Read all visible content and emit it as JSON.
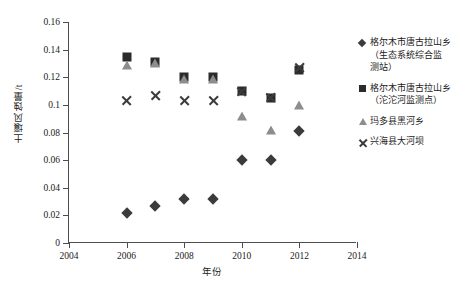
{
  "chart_data": {
    "type": "scatter",
    "title": "",
    "xlabel": "年份",
    "ylabel": "土壤风蚀量/t",
    "xlim": [
      2004,
      2014
    ],
    "ylim": [
      0,
      0.16
    ],
    "xticks": [
      2004,
      2006,
      2008,
      2010,
      2012,
      2014
    ],
    "xtick_labels": [
      "2004",
      "2006",
      "2008",
      "2010",
      "2012",
      "2014"
    ],
    "yticks": [
      0,
      0.02,
      0.04,
      0.06,
      0.08,
      0.1,
      0.12,
      0.14,
      0.16
    ],
    "ytick_labels": [
      "0",
      "0.02",
      "0.04",
      "0.06",
      "0.08",
      "0.1",
      "0.12",
      "0.14",
      "0.16"
    ],
    "grid": false,
    "legend_position": "right",
    "x": [
      2006,
      2007,
      2008,
      2009,
      2010,
      2011,
      2012
    ],
    "series": [
      {
        "name": "格尔木市唐古拉山乡\n（生态系统综合监\n测站）",
        "marker": "diamond",
        "color": "#3b3b3b",
        "values": [
          0.022,
          0.027,
          0.032,
          0.032,
          0.06,
          0.06,
          0.081
        ]
      },
      {
        "name": "格尔木市唐古拉山乡\n（沱沱河监测点）",
        "marker": "square",
        "color": "#2b2b2b",
        "values": [
          0.135,
          0.131,
          0.12,
          0.12,
          0.11,
          0.105,
          0.125
        ]
      },
      {
        "name": "玛多县黑河乡",
        "marker": "triangle",
        "color": "#8d8d8d",
        "values": [
          0.129,
          0.13,
          0.119,
          0.119,
          0.092,
          0.082,
          0.1
        ]
      },
      {
        "name": "兴海县大河坝",
        "marker": "cross",
        "color": "#3b3b3b",
        "values": [
          0.103,
          0.107,
          0.103,
          0.103,
          0.11,
          0.105,
          0.127
        ]
      }
    ]
  },
  "caption": ""
}
